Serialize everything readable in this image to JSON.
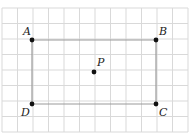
{
  "diagram": {
    "type": "rectangle-on-grid",
    "grid": {
      "x0": 2,
      "y0": 8,
      "cols": 12,
      "rows": 8,
      "cell": 15.5,
      "line_color": "#d9d9d9"
    },
    "rectangle": {
      "vertices": [
        "A",
        "B",
        "C",
        "D"
      ],
      "stroke_color": "#9a9a9a"
    },
    "points": [
      {
        "name": "A",
        "x": 32,
        "y": 40,
        "label_dx": -9,
        "label_dy": -5
      },
      {
        "name": "B",
        "x": 156,
        "y": 40,
        "label_dx": 3,
        "label_dy": -5
      },
      {
        "name": "C",
        "x": 156,
        "y": 104,
        "label_dx": 3,
        "label_dy": 12
      },
      {
        "name": "D",
        "x": 32,
        "y": 104,
        "label_dx": -11,
        "label_dy": 12
      },
      {
        "name": "P",
        "x": 94,
        "y": 72,
        "label_dx": 3,
        "label_dy": -6
      }
    ],
    "point_color": "#111111"
  }
}
